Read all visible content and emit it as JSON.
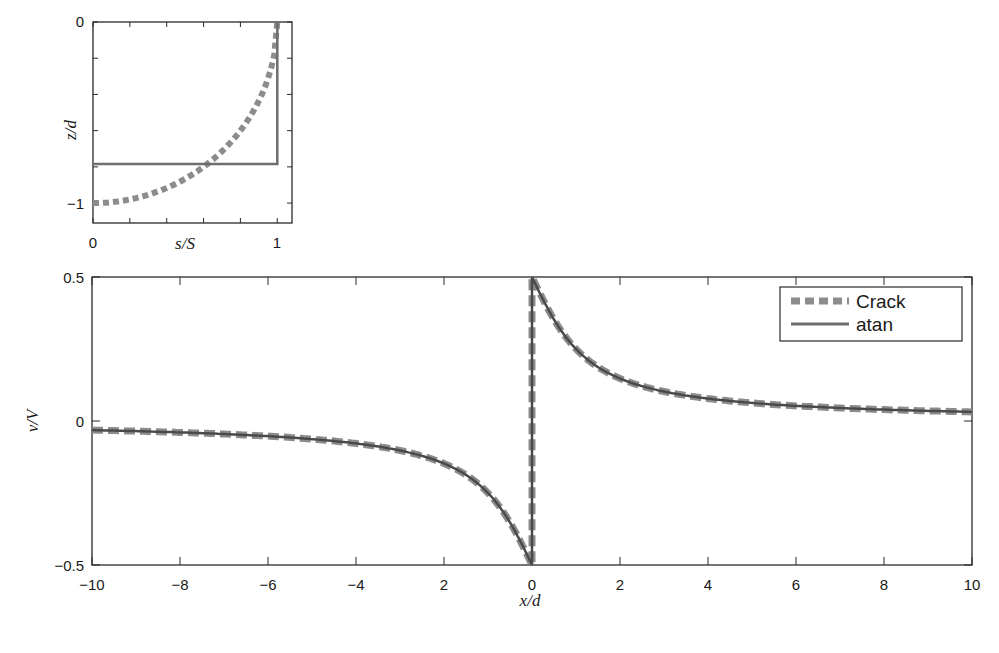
{
  "chart_data": [
    {
      "id": "inset",
      "type": "line",
      "title": "",
      "xlabel": "s/S",
      "ylabel": "z/d",
      "xlim": [
        0,
        1.08
      ],
      "ylim": [
        -1.11,
        0
      ],
      "x_ticks": [
        0,
        0.2,
        0.4,
        0.6,
        0.8,
        1.0
      ],
      "x_tick_labels": [
        "0",
        "",
        "",
        "",
        "",
        "1"
      ],
      "y_ticks": [
        0,
        -0.2,
        -0.4,
        -0.6,
        -0.8,
        -1.0
      ],
      "y_tick_labels": [
        "0",
        "",
        "",
        "",
        "",
        "−1"
      ],
      "grid": false,
      "series": [
        {
          "name": "Crack",
          "style": "dotted-thick",
          "color": "#8c8c8c",
          "x": [
            0,
            0.1,
            0.2,
            0.3,
            0.4,
            0.5,
            0.6,
            0.7,
            0.8,
            0.9,
            0.95,
            0.98,
            1.0
          ],
          "y": [
            -1.0,
            -0.995,
            -0.98,
            -0.954,
            -0.917,
            -0.866,
            -0.8,
            -0.714,
            -0.6,
            -0.436,
            -0.312,
            -0.199,
            0.0
          ]
        },
        {
          "name": "atan",
          "style": "solid",
          "color": "#6e6e6e",
          "x": [
            0,
            1.0,
            1.0
          ],
          "y": [
            -0.785,
            -0.785,
            0.0
          ]
        }
      ]
    },
    {
      "id": "main",
      "type": "line",
      "title": "",
      "xlabel": "x/d",
      "ylabel": "v/V",
      "xlim": [
        -10,
        10
      ],
      "ylim": [
        -0.5,
        0.5
      ],
      "x_ticks": [
        -10,
        -8,
        -6,
        -4,
        -2,
        0,
        2,
        4,
        6,
        8,
        10
      ],
      "x_tick_labels": [
        "−10",
        "−8",
        "−6",
        "−4",
        "2",
        "0",
        "2",
        "4",
        "6",
        "8",
        "10"
      ],
      "y_ticks": [
        -0.5,
        0,
        0.5
      ],
      "y_tick_labels": [
        "−0.5",
        "0",
        "0.5"
      ],
      "grid": false,
      "legend": {
        "position": "upper right",
        "entries": [
          "Crack",
          "atan"
        ]
      },
      "series": [
        {
          "name": "Crack",
          "style": "dashed-thick",
          "color": "#8c8c8c",
          "x": [
            -10,
            -8,
            -6,
            -5,
            -4,
            -3,
            -2,
            -1.5,
            -1,
            -0.6,
            -0.3,
            -0.1,
            0,
            0,
            0.1,
            0.3,
            0.6,
            1,
            1.5,
            2,
            3,
            4,
            5,
            6,
            8,
            10
          ],
          "y": [
            -0.032,
            -0.04,
            -0.053,
            -0.063,
            -0.078,
            -0.102,
            -0.148,
            -0.187,
            -0.25,
            -0.328,
            -0.407,
            -0.468,
            -0.5,
            0.5,
            0.468,
            0.407,
            0.328,
            0.25,
            0.187,
            0.148,
            0.102,
            0.078,
            0.063,
            0.053,
            0.04,
            0.032
          ]
        },
        {
          "name": "atan",
          "style": "solid",
          "color": "#4a4a4a",
          "x": [
            -10,
            -8,
            -6,
            -5,
            -4,
            -3,
            -2,
            -1.5,
            -1,
            -0.6,
            -0.3,
            -0.1,
            0,
            0,
            0.1,
            0.3,
            0.6,
            1,
            1.5,
            2,
            3,
            4,
            5,
            6,
            8,
            10
          ],
          "y": [
            -0.032,
            -0.04,
            -0.053,
            -0.063,
            -0.078,
            -0.102,
            -0.148,
            -0.187,
            -0.25,
            -0.328,
            -0.407,
            -0.468,
            -0.5,
            0.5,
            0.468,
            0.407,
            0.328,
            0.25,
            0.187,
            0.148,
            0.102,
            0.078,
            0.063,
            0.053,
            0.04,
            0.032
          ]
        }
      ]
    }
  ],
  "legend": {
    "crack_label": "Crack",
    "atan_label": "atan"
  },
  "inset": {
    "xlabel": "s/S",
    "ylabel": "z/d",
    "x_tick_0": "0",
    "x_tick_1": "1",
    "y_tick_0": "0",
    "y_tick_m1": "−1"
  },
  "main": {
    "xlabel": "x/d",
    "ylabel": "v/V",
    "y_tick_top": "0.5",
    "y_tick_mid": "0",
    "y_tick_bot": "−0.5",
    "x_ticks": [
      "−10",
      "−8",
      "−6",
      "−4",
      "2",
      "0",
      "2",
      "4",
      "6",
      "8",
      "10"
    ]
  }
}
